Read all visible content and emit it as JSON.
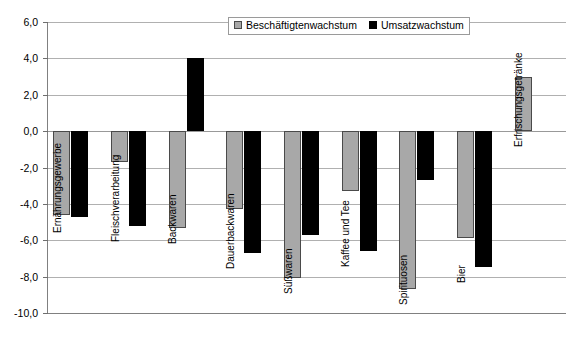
{
  "chart_data": {
    "type": "bar",
    "title": "",
    "xlabel": "",
    "ylabel": "",
    "ylim": [
      -10.0,
      6.0
    ],
    "ytick_step": 2.0,
    "grid": true,
    "legend_position": "top-right",
    "decimal_separator": ",",
    "categories": [
      "Ernährungsgewerbe",
      "Fleischverarbeitung",
      "Backwaren",
      "Dauerbackwaren",
      "Süßwaren",
      "Kaffee und Tee",
      "Spirituosen",
      "Bier",
      "Erfrischungsgetränke"
    ],
    "ytick_labels": [
      "6,0",
      "4,0",
      "2,0",
      "0,0",
      "-2,0",
      "-4,0",
      "-6,0",
      "-8,0",
      "-10,0"
    ],
    "ytick_values": [
      6.0,
      4.0,
      2.0,
      0.0,
      -2.0,
      -4.0,
      -6.0,
      -8.0,
      -10.0
    ],
    "series": [
      {
        "name": "Beschäftigtenwachstum",
        "color": "#a8a8a8",
        "values": [
          -4.6,
          -1.7,
          -5.3,
          -4.3,
          -8.1,
          -3.3,
          -8.7,
          -5.85,
          3.0
        ]
      },
      {
        "name": "Umsatzwachstum",
        "color": "#000000",
        "values": [
          -4.7,
          -5.2,
          4.0,
          -6.7,
          -5.7,
          -6.6,
          -2.7,
          -7.45,
          null
        ]
      }
    ]
  },
  "legend": {
    "items": [
      {
        "label": "Beschäftigtenwachstum",
        "swatch": "gray"
      },
      {
        "label": "Umsatzwachstum",
        "swatch": "black"
      }
    ]
  }
}
